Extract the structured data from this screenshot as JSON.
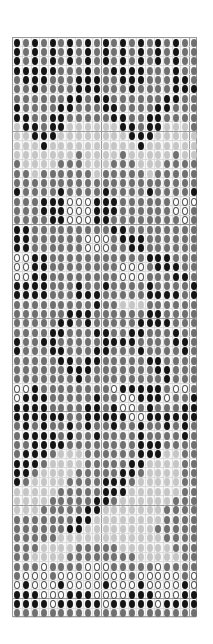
{
  "chart_data": {
    "type": "heatmap",
    "title": "",
    "columns": 21,
    "rows_count": 62,
    "legend": {
      "K": "#141414",
      "M": "#707070",
      "L": "#c6c6c6",
      "W": "#ffffff"
    },
    "major_grid_every": 10,
    "rows": [
      "KMKMKMKMKMKMKMKMKMKMM",
      "KMKMKMKMKMKMKMKMKMKMM",
      "KMKMKMKMKMKMKMKMKMKMM",
      "KKKKKMMMKMMKKKKMMMKMM",
      "MKKKMMMKKKMMKKKMMMKKM",
      "MMKMMMMKKKMMMKMMMMKKK",
      "MMMMMMKKMKKMMMMMMKKMM",
      "KMMMMKKMMMKKMMMMKKMMM",
      "KKMMKKMMMMMKKMMKKMMMM",
      "LKKMKKLLLLLLKKMKKLLLM",
      "LLKKKLLLLLLLLKKKLLLLL",
      "LLLKLLLLLLLLLLKLLLLLL",
      "LLLLLLLMLLLLMLLLLLMLL",
      "MLLLLMMMLLLMMMLLLMMMM",
      "MMLMMMMMMLMMMMMLMMMMM",
      "MMMMMMMMMMMMMMMMMMMMM",
      "KMMMMKMMMMKMMMMKMMMMK",
      "MMMKKKWWWKKKMMMMMMWWW",
      "MMMKKKWWWKKKMMMMMMWWM",
      "MMMMKKWWWKKMMMMMMMMWM",
      "KKMMMMMMMMMKKMMMMMMMM",
      "KKMMMMMMWWWMKKKMMMMMM",
      "KKMMMMMMWWWMMKKMMMMMM",
      "WWKKMMMMMMMMMMMKKKMMM",
      "WWKKMMMMMMMMWWWMKKKMM",
      "WWKKMMMMMMMMWWWMMMKKM",
      "KKKKMMMKMMKMMMMKMMMMK",
      "KKKKMMMKKKMMMMMKKKKMK",
      "MMMMMMMMMKMMLLLMMMMMM",
      "MMMMMMKKKMMMMMMKKMMMM",
      "MMMMMKKMKMMMMMKKKKMMM",
      "MMMMKKMMMKKMMKKMMMKMM",
      "KMMKKMMMMMKKKKMMMMKKM",
      "KMMMKKMMMKKMMMKMMMMKM",
      "MMMMMKKMKKMMMMMKKMMMM",
      "MMMMMMKKKMMMMMMMKKMMM",
      "MMMMMMMKMMMMMMMMMKMMM",
      "WWKMMMMMMMMWKKKKKMWWM",
      "WKKKMMMMMKMMWWKKKWMMK",
      "KKKKMMMMKKMKWWMKMMMKK",
      "KKKKKKMMKKKKKWWKKKKKK",
      "MKMKMMKMKMMKMMKMMKMKM",
      "MKKKKMKMMKMMMMKMMMMKM",
      "MMKKKKMMMMMMMMKKKMMMM",
      "MKKKMLLLMMMMMMKKKLLMM",
      "KKKMLLLLMMMMMKKLLLLMM",
      "KKMLLLLMMMMMKKMLLLLMM",
      "KMLLLLMMMMKKKMLLLLLMM",
      "LLLLLMMMMMKKKLLLLLLMM",
      "LLLLMMMMMKKMLLLLLLMMM",
      "LLLMMMMMKKLLLLLLLMMMM",
      "MMMMMMMKKLLLLLLLLMMMM",
      "MMMMMMKKLLLLLLLLMMMMM",
      "MMMMMLLLLLLLLLLLLMMMM",
      "MMMLLLLMMMMMLLLLLLMMM",
      "MMLLLLMMMMMMMMLLLLLMM",
      "MMMWMMMMWWWMMMMMWMMMM",
      "MWWWMWWWWWWWWMWWWWWMW",
      "WKWWWKWWWWKWWWKWWWWKW",
      "KKKWWWKKKWWWWKKKWWWKK",
      "KKKKWKKKKKWKKKKKWKKKK",
      "MMMMMMMMMMMMMMMMMMMMM"
    ]
  }
}
